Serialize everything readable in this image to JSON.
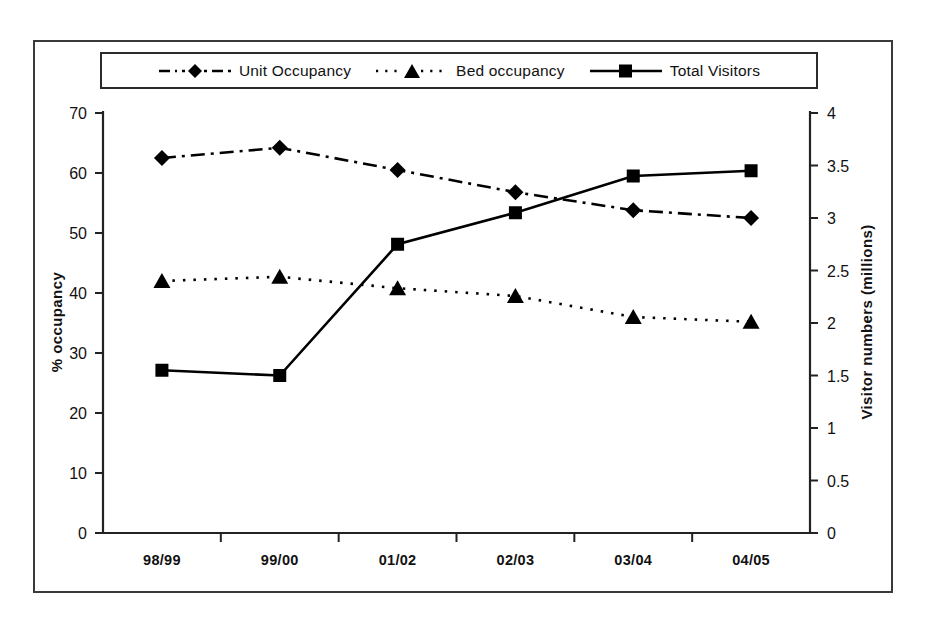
{
  "chart_data": {
    "type": "line",
    "title": "",
    "subtitle": "",
    "xlabel": "",
    "ylabel": "% occupancy",
    "y2label": "Visitor numbers (millions)",
    "categories": [
      "98/99",
      "99/00",
      "01/02",
      "02/03",
      "03/04",
      "04/05"
    ],
    "ylim": [
      0,
      70
    ],
    "yticks": [
      "0",
      "10",
      "20",
      "30",
      "40",
      "50",
      "60",
      "70"
    ],
    "ytick_values": [
      0,
      10,
      20,
      30,
      40,
      50,
      60,
      70
    ],
    "y2lim": [
      0,
      4
    ],
    "y2ticks": [
      "0",
      "0.5",
      "1",
      "1.5",
      "2",
      "2.5",
      "3",
      "3.5",
      "4"
    ],
    "y2tick_values": [
      0,
      0.5,
      1,
      1.5,
      2,
      2.5,
      3,
      3.5,
      4
    ],
    "grid": false,
    "legend_position": "top",
    "series": [
      {
        "name": "Unit Occupancy",
        "axis": "left",
        "marker": "diamond",
        "linestyle": "dash-dot",
        "color": "#000000",
        "values": [
          62.5,
          64.2,
          60.5,
          56.8,
          53.8,
          52.5
        ]
      },
      {
        "name": "Bed occupancy",
        "axis": "left",
        "marker": "triangle",
        "linestyle": "dotted",
        "color": "#000000",
        "values": [
          42.0,
          42.7,
          40.8,
          39.5,
          36.0,
          35.2
        ]
      },
      {
        "name": "Total Visitors",
        "axis": "right",
        "marker": "square",
        "linestyle": "solid",
        "color": "#000000",
        "values": [
          1.55,
          1.5,
          2.75,
          3.05,
          3.4,
          3.45
        ]
      }
    ]
  },
  "legend": {
    "items": [
      {
        "label": "Unit Occupancy",
        "key": "dashdot-diamond-key"
      },
      {
        "label": "Bed occupancy",
        "key": "dotted-triangle-key"
      },
      {
        "label": "Total Visitors",
        "key": "solid-square-key"
      }
    ]
  },
  "axes": {
    "left_title": "% occupancy",
    "right_title": "Visitor numbers (millions)"
  }
}
